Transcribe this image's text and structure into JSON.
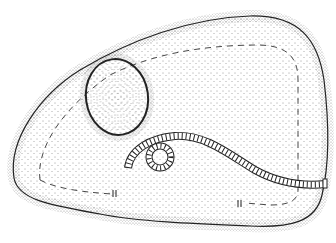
{
  "illustration": {
    "subject": "stippled line drawing of a rounded pad with an oval recess and a coiled rope",
    "background_color": "#ffffff",
    "ink_color": "#222222",
    "elements": [
      {
        "name": "pad-outline",
        "shape": "rounded irregular blob"
      },
      {
        "name": "dashed-inner-border",
        "style": "dashed"
      },
      {
        "name": "oval-recess",
        "shape": "egg-shaped oval"
      },
      {
        "name": "rope",
        "style": "twisted, coiled at left end"
      },
      {
        "name": "break-marks",
        "count": 2
      }
    ]
  }
}
